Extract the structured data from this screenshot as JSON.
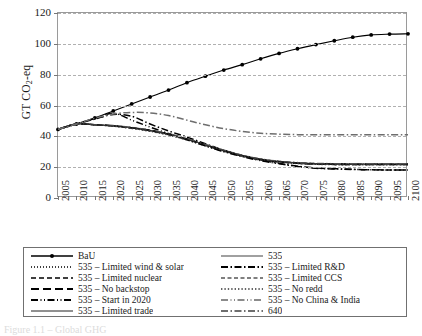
{
  "chart_data": {
    "type": "line",
    "title": "",
    "xlabel": "",
    "ylabel": "GT CO2-eq",
    "ylabel_prefix": "GT CO",
    "ylabel_sub": "2",
    "ylabel_suffix": "-eq",
    "xlim": [
      2005,
      2100
    ],
    "ylim": [
      0,
      120
    ],
    "yticks": [
      0,
      20,
      40,
      60,
      80,
      100,
      120
    ],
    "grid": true,
    "legend_position": "bottom",
    "x": [
      2005,
      2010,
      2015,
      2020,
      2025,
      2030,
      2035,
      2040,
      2045,
      2050,
      2055,
      2060,
      2065,
      2070,
      2075,
      2080,
      2085,
      2090,
      2095,
      2100
    ],
    "categories": [
      "2005",
      "2010",
      "2015",
      "2020",
      "2025",
      "2030",
      "2035",
      "2040",
      "2045",
      "2050",
      "2055",
      "2060",
      "2065",
      "2070",
      "2075",
      "2080",
      "2085",
      "2090",
      "2095",
      "2100"
    ],
    "series": [
      {
        "name": "BaU",
        "style": "solid-marker",
        "color": "#000000",
        "values": [
          44.5,
          48.0,
          52.0,
          56.5,
          61.0,
          65.5,
          70.0,
          74.8,
          79.0,
          83.0,
          86.5,
          90.3,
          93.8,
          96.8,
          99.5,
          102.0,
          104.3,
          105.8,
          106.3,
          106.5
        ]
      },
      {
        "name": "535",
        "style": "solid",
        "color": "#808080",
        "values": [
          44.5,
          48.0,
          47.5,
          46.8,
          45.6,
          43.9,
          41.5,
          38.3,
          34.5,
          30.9,
          27.6,
          25.2,
          23.7,
          22.8,
          22.3,
          22.1,
          22.0,
          22.0,
          22.0,
          22.0
        ]
      },
      {
        "name": "535 – Limited wind & solar",
        "style": "dotted",
        "color": "#000000",
        "values": [
          44.5,
          48.0,
          47.5,
          46.8,
          45.5,
          43.8,
          41.4,
          38.2,
          34.4,
          30.8,
          27.5,
          25.1,
          23.6,
          22.7,
          22.2,
          22.0,
          21.9,
          21.9,
          21.9,
          21.9
        ]
      },
      {
        "name": "535 – Limited R&D",
        "style": "dash-dot",
        "color": "#000000",
        "values": [
          44.5,
          48.0,
          51.2,
          54.2,
          53.0,
          48.0,
          43.5,
          39.5,
          35.2,
          31.0,
          27.4,
          24.6,
          22.5,
          20.6,
          19.5,
          19.0,
          18.6,
          18.3,
          18.2,
          18.2
        ]
      },
      {
        "name": "535 – Limited nuclear",
        "style": "dashed",
        "color": "#000000",
        "values": [
          44.5,
          48.0,
          47.5,
          46.8,
          45.6,
          43.9,
          41.5,
          38.3,
          34.5,
          30.9,
          27.6,
          25.2,
          23.7,
          22.8,
          22.3,
          22.1,
          22.0,
          22.0,
          22.0,
          22.0
        ]
      },
      {
        "name": "535 – Limited CCS",
        "style": "dashed-gray",
        "color": "#555555",
        "values": [
          44.5,
          48.0,
          47.5,
          46.6,
          45.2,
          43.4,
          41.0,
          37.8,
          34.0,
          30.4,
          27.2,
          24.8,
          23.3,
          22.4,
          21.9,
          21.7,
          21.6,
          21.6,
          21.6,
          21.6
        ]
      },
      {
        "name": "535 – No backstop",
        "style": "long-dash",
        "color": "#000000",
        "values": [
          44.5,
          48.0,
          47.5,
          46.8,
          45.6,
          43.8,
          41.4,
          38.1,
          34.3,
          30.6,
          27.3,
          24.9,
          23.4,
          22.5,
          22.0,
          21.8,
          21.7,
          21.7,
          21.7,
          21.7
        ]
      },
      {
        "name": "535 – No redd",
        "style": "dotted-heavy",
        "color": "#333333",
        "values": [
          44.5,
          48.0,
          47.4,
          46.5,
          45.1,
          43.2,
          40.8,
          37.6,
          33.8,
          30.2,
          27.0,
          24.7,
          23.2,
          22.3,
          21.8,
          21.6,
          21.5,
          21.5,
          21.5,
          21.5
        ]
      },
      {
        "name": "535 – Start in 2020",
        "style": "dash-dot-dot",
        "color": "#000000",
        "values": [
          44.5,
          48.0,
          51.5,
          55.0,
          50.5,
          46.0,
          41.8,
          37.8,
          33.8,
          30.0,
          26.8,
          24.2,
          22.2,
          20.4,
          19.3,
          18.8,
          18.5,
          18.3,
          18.2,
          18.2
        ]
      },
      {
        "name": "535 – No China & India",
        "style": "dash-dot-dot-gray",
        "color": "#666666",
        "values": [
          44.5,
          48.0,
          47.6,
          47.0,
          45.8,
          44.1,
          41.7,
          38.5,
          34.7,
          31.1,
          27.8,
          25.4,
          23.9,
          23.0,
          22.5,
          22.3,
          22.2,
          22.2,
          22.2,
          22.2
        ]
      },
      {
        "name": "535 – Limited trade",
        "style": "thin-solid",
        "color": "#222222",
        "values": [
          44.5,
          48.0,
          47.5,
          46.8,
          45.6,
          43.9,
          41.5,
          38.3,
          34.5,
          30.9,
          27.6,
          25.2,
          23.7,
          22.8,
          22.3,
          22.1,
          22.0,
          22.0,
          22.0,
          22.0
        ]
      },
      {
        "name": "640",
        "style": "dash-dot-gray",
        "color": "#6e6e6e",
        "values": [
          44.5,
          48.0,
          51.8,
          54.5,
          55.5,
          55.2,
          53.5,
          50.5,
          47.5,
          45.0,
          43.2,
          42.0,
          41.4,
          41.1,
          41.0,
          41.0,
          41.0,
          41.0,
          41.0,
          41.0
        ]
      }
    ],
    "legend": {
      "columns": [
        [
          {
            "label": "BaU",
            "style": "solid-marker"
          },
          {
            "label": "535 – Limited wind & solar",
            "style": "dotted"
          },
          {
            "label": "535 – Limited nuclear",
            "style": "dashed"
          },
          {
            "label": "535 – No backstop",
            "style": "long-dash"
          },
          {
            "label": "535 – Start in 2020",
            "style": "dash-dot-dot"
          },
          {
            "label": "535 – Limited trade",
            "style": "thin-solid"
          }
        ],
        [
          {
            "label": "535",
            "style": "solid"
          },
          {
            "label": "535 – Limited R&D",
            "style": "dash-dot"
          },
          {
            "label": "535 – Limited CCS",
            "style": "dashed-gray"
          },
          {
            "label": "535 – No redd",
            "style": "dotted-heavy"
          },
          {
            "label": "535 – No China & India",
            "style": "dash-dot-dot-gray"
          },
          {
            "label": "640",
            "style": "dash-dot-gray"
          }
        ]
      ]
    }
  },
  "caption": {
    "text": "Figure 1.1 – Global GHG"
  }
}
